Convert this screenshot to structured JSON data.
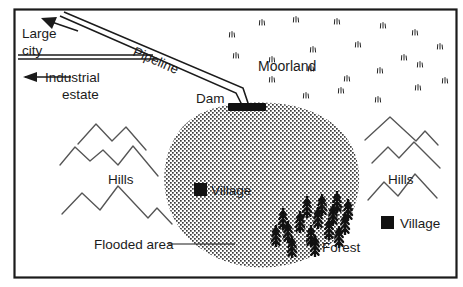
{
  "figure": {
    "kind": "reservoir-map-diagram",
    "frame_color": "#1b1b1b",
    "background_color": "#ffffff",
    "ink_color": "#1b1b1b",
    "hill_stroke_color": "#555555",
    "water_fill_color": "#3a3a3a",
    "width": 463,
    "height": 287
  },
  "labels": {
    "large_city": "Large\ncity",
    "large_city_line1": "Large",
    "large_city_line2": "city",
    "industrial_estate_line1": "Industrial",
    "industrial_estate_line2": "estate",
    "pipeline": "Pipeline",
    "dam": "Dam",
    "moorland": "Moorland",
    "hills_left": "Hills",
    "hills_right": "Hills",
    "flooded_area": "Flooded area",
    "forest": "Forest",
    "village_on_map": "Village",
    "village_legend": "Village"
  },
  "symbols": {
    "village_marker": "filled-square",
    "dam_marker": "filled-bar",
    "tree_marker": "conifer-tree",
    "moorland_marker": "grass-tuft",
    "hill_marker": "zigzag-ridge",
    "water_marker": "stipple-fill"
  },
  "counts": {
    "moorland_tufts": 22,
    "forest_trees": 16,
    "hill_ridges_left": 3,
    "hill_ridges_right": 3,
    "village_markers": 2
  },
  "moorland_tufts": [
    {
      "x": 262,
      "y": 22
    },
    {
      "x": 232,
      "y": 34
    },
    {
      "x": 296,
      "y": 19
    },
    {
      "x": 337,
      "y": 21
    },
    {
      "x": 383,
      "y": 25
    },
    {
      "x": 415,
      "y": 32
    },
    {
      "x": 236,
      "y": 55
    },
    {
      "x": 272,
      "y": 59
    },
    {
      "x": 313,
      "y": 49
    },
    {
      "x": 358,
      "y": 44
    },
    {
      "x": 404,
      "y": 57
    },
    {
      "x": 440,
      "y": 46
    },
    {
      "x": 272,
      "y": 79
    },
    {
      "x": 311,
      "y": 68
    },
    {
      "x": 347,
      "y": 78
    },
    {
      "x": 380,
      "y": 70
    },
    {
      "x": 420,
      "y": 64
    },
    {
      "x": 445,
      "y": 80
    },
    {
      "x": 306,
      "y": 95
    },
    {
      "x": 341,
      "y": 90
    },
    {
      "x": 378,
      "y": 99
    },
    {
      "x": 418,
      "y": 87
    }
  ],
  "forest_trees": [
    {
      "x": 292,
      "y": 247
    },
    {
      "x": 288,
      "y": 232
    },
    {
      "x": 300,
      "y": 222
    },
    {
      "x": 311,
      "y": 236
    },
    {
      "x": 307,
      "y": 207
    },
    {
      "x": 318,
      "y": 218
    },
    {
      "x": 322,
      "y": 205
    },
    {
      "x": 329,
      "y": 229
    },
    {
      "x": 333,
      "y": 215
    },
    {
      "x": 337,
      "y": 202
    },
    {
      "x": 345,
      "y": 224
    },
    {
      "x": 348,
      "y": 210
    },
    {
      "x": 276,
      "y": 236
    },
    {
      "x": 283,
      "y": 219
    },
    {
      "x": 315,
      "y": 246
    },
    {
      "x": 339,
      "y": 237
    }
  ],
  "map_elements": [
    {
      "name": "frame",
      "type": "rect",
      "interactable": false
    },
    {
      "name": "flooded-area-blob",
      "type": "polygon",
      "interactable": false
    },
    {
      "name": "pipeline",
      "type": "double-line",
      "interactable": false
    },
    {
      "name": "dam",
      "type": "bar",
      "interactable": false
    }
  ]
}
